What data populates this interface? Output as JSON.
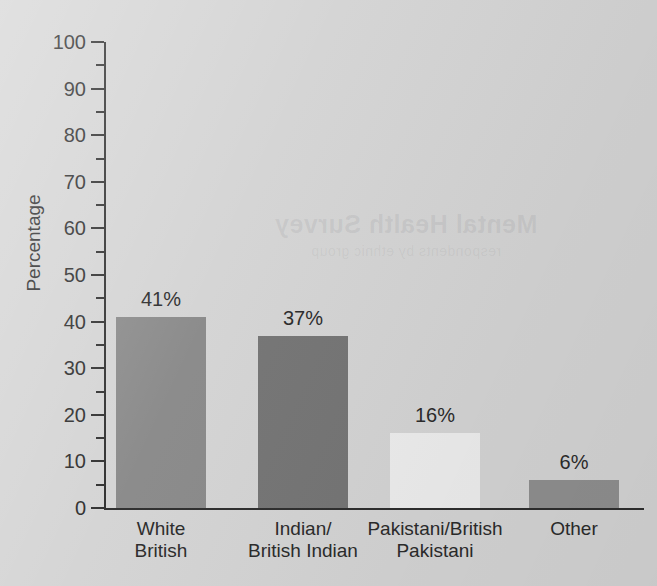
{
  "chart_data": {
    "type": "bar",
    "title": "",
    "xlabel": "",
    "ylabel": "Percentage",
    "categories": [
      "White\nBritish",
      "Indian/\nBritish Indian",
      "Pakistani/British\nPakistani",
      "Other"
    ],
    "values": [
      41,
      37,
      16,
      6
    ],
    "value_labels": [
      "41%",
      "37%",
      "16%",
      "6%"
    ],
    "bar_colors": [
      "#8a8a8a",
      "#757575",
      "#ededed",
      "#8f8f8f"
    ],
    "ylim": [
      0,
      100
    ],
    "y_major_ticks": [
      0,
      10,
      20,
      30,
      40,
      50,
      60,
      70,
      80,
      90,
      100
    ],
    "y_minor_ticks": [
      5,
      15,
      25,
      35,
      45,
      55,
      65,
      75,
      85,
      95
    ],
    "y_tick_labels": [
      "0",
      "10",
      "20",
      "30",
      "40",
      "50",
      "60",
      "70",
      "80",
      "90",
      "100"
    ],
    "grid": false,
    "legend": null,
    "axis_color": "#2e2e2e",
    "background_color": "#d4d4d4"
  },
  "page": {
    "bleed_text": "Mental Health Survey",
    "bleed_subtext": "respondents by ethnic group"
  }
}
